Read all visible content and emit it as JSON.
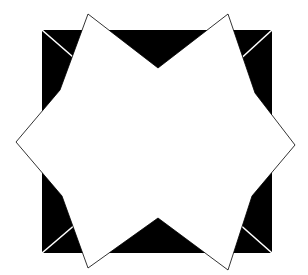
{
  "figure": {
    "canvas": {
      "width": 308,
      "height": 275,
      "background_color": "#ffffff"
    },
    "shapes": {
      "square": {
        "name": "black-square",
        "fill_color": "#000000",
        "left": 42,
        "top": 30,
        "right": 272,
        "bottom": 253,
        "width": 230,
        "height": 223,
        "corners": [
          [
            42,
            30
          ],
          [
            272,
            30
          ],
          [
            272,
            253
          ],
          [
            42,
            253
          ]
        ]
      },
      "star": {
        "name": "white-star",
        "fill_color": "#ffffff",
        "stroke_color": "#000000",
        "stroke_width": 0.8,
        "point_count": 8,
        "center": [
          156,
          141
        ],
        "outer_points": [
          [
            88,
            14
          ],
          [
            228,
            14
          ],
          [
            295,
            145
          ],
          [
            228,
            270
          ],
          [
            88,
            268
          ],
          [
            16,
            142
          ]
        ],
        "inner_points": [
          [
            158,
            68
          ],
          [
            255,
            93
          ],
          [
            252,
            196
          ],
          [
            158,
            218
          ],
          [
            62,
            196
          ],
          [
            60,
            90
          ]
        ],
        "polygon_points": "88,14 158,68 228,14 255,93 295,145 252,196 228,270 158,218 88,268 62,196 16,142 60,90"
      },
      "corner_diagonals": [
        {
          "name": "diagonal-top-left",
          "from": [
            42,
            30
          ],
          "to": [
            104,
            84
          ],
          "color": "#ffffff"
        },
        {
          "name": "diagonal-top-right",
          "from": [
            272,
            30
          ],
          "to": [
            212,
            85
          ],
          "color": "#ffffff"
        },
        {
          "name": "diagonal-bottom-left",
          "from": [
            42,
            253
          ],
          "to": [
            104,
            200
          ],
          "color": "#ffffff"
        },
        {
          "name": "diagonal-bottom-right",
          "from": [
            272,
            253
          ],
          "to": [
            212,
            200
          ],
          "color": "#ffffff"
        }
      ]
    },
    "colors": {
      "foreground": "#000000",
      "background": "#ffffff"
    }
  }
}
